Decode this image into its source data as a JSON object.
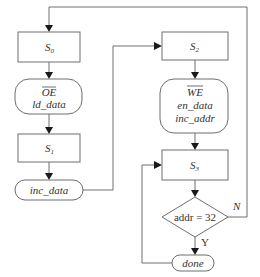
{
  "diagram": {
    "type": "state-flowchart",
    "states": [
      {
        "id": "s0",
        "label": "S",
        "subscript": "0"
      },
      {
        "id": "s1",
        "label": "S",
        "subscript": "1"
      },
      {
        "id": "s2",
        "label": "S",
        "subscript": "2"
      },
      {
        "id": "s3",
        "label": "S",
        "subscript": "3"
      }
    ],
    "actions": {
      "oe_block": {
        "line1": "OE",
        "line1_overbar": true,
        "line2": "ld_data"
      },
      "inc_data": "inc_data",
      "we_block": {
        "line1": "WE",
        "line1_overbar": true,
        "line2": "en_data",
        "line3": "inc_addr"
      },
      "done": "done"
    },
    "decision": {
      "label": "addr = 32",
      "yes_label": "Y",
      "no_label": "N"
    },
    "edges": [
      {
        "from": "s0",
        "to": "oe_block"
      },
      {
        "from": "oe_block",
        "to": "s1"
      },
      {
        "from": "s1",
        "to": "inc_data"
      },
      {
        "from": "inc_data",
        "to": "s2"
      },
      {
        "from": "s2",
        "to": "we_block"
      },
      {
        "from": "we_block",
        "to": "s3"
      },
      {
        "from": "s3",
        "to": "decision"
      },
      {
        "from": "decision",
        "to": "done",
        "label": "Y"
      },
      {
        "from": "decision",
        "to": "s0",
        "label": "N"
      },
      {
        "from": "done",
        "to": "s3"
      }
    ],
    "colors": {
      "stroke": "#6e6e6e",
      "arrow": "#1a1a1a",
      "text": "#333333"
    }
  }
}
